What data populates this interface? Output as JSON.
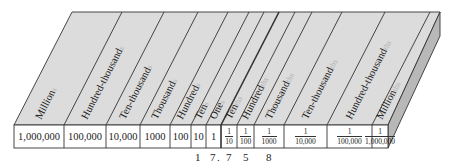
{
  "colors": {
    "top_face": "#dcdcdc",
    "side_face": "#b8b8b8",
    "front_face": "#ffffff",
    "line": "#333333",
    "suffix": "#b0b0b0",
    "text": "#222222"
  },
  "columns": [
    {
      "label": "Million",
      "suffix": "s",
      "value": "1,000,000"
    },
    {
      "label": "Hundred-thousand",
      "suffix": "s",
      "value": "100,000"
    },
    {
      "label": "Ten-thousand",
      "suffix": "s",
      "value": "10,000"
    },
    {
      "label": "Thousand",
      "suffix": "s",
      "value": "1000"
    },
    {
      "label": "Hundred",
      "suffix": "s",
      "value": "100"
    },
    {
      "label": "Ten",
      "suffix": "s",
      "value": "10"
    },
    {
      "label": "One",
      "suffix": "s",
      "value": "1"
    },
    {
      "label": "Ten",
      "suffix": "ths",
      "numerator": "1",
      "denominator": "10"
    },
    {
      "label": "Hundred",
      "suffix": "ths",
      "numerator": "1",
      "denominator": "100"
    },
    {
      "label": "Thousand",
      "suffix": "ths",
      "numerator": "1",
      "denominator": "1000"
    },
    {
      "label": "Ten-thousand",
      "suffix": "ths",
      "numerator": "1",
      "denominator": "10,000"
    },
    {
      "label": "Hundred-thousand",
      "suffix": "ths",
      "numerator": "1",
      "denominator": "100,000"
    },
    {
      "label": "Million",
      "suffix": "ths",
      "numerator": "1",
      "denominator": "1,000,000"
    }
  ],
  "example_number": {
    "digits": [
      "1",
      "7",
      ".",
      "7",
      "5",
      "8"
    ]
  }
}
